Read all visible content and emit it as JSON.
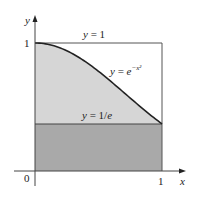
{
  "figure": {
    "labels": {
      "y_axis": "y",
      "x_axis": "x",
      "origin": "0",
      "x_tick_1": "1",
      "y_tick_1": "1",
      "line_top": {
        "var": "y",
        "eq": " = 1"
      },
      "curve": {
        "var": "y",
        "eq": " = ",
        "base": "e",
        "exp": "−x²"
      },
      "line_bottom": {
        "var": "y",
        "eq": " = 1/",
        "e": "e"
      }
    },
    "colors": {
      "light_region": "#d6d6d6",
      "dark_region": "#a9a9a9",
      "lines": "#333333"
    },
    "function": "e^(-x^2)",
    "x_range": [
      0,
      1
    ],
    "y_range": [
      0,
      1
    ],
    "reference_lines": [
      1,
      0.3679
    ]
  }
}
